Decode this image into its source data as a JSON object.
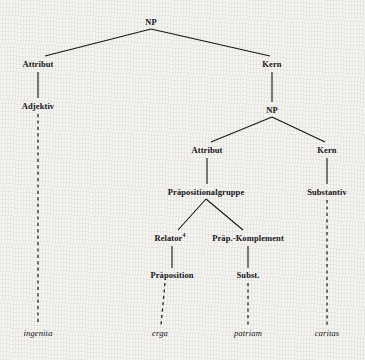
{
  "diagram": {
    "type": "syntactic-tree",
    "title": "",
    "language": "de",
    "colors": {
      "ink": "#16161a",
      "paper": "#f6f5f2"
    },
    "nodes": [
      {
        "id": "np-root",
        "label": "NP",
        "kind": "category",
        "x": 151,
        "y": 22
      },
      {
        "id": "attribut-1",
        "label": "Attribut",
        "kind": "category",
        "x": 38,
        "y": 64
      },
      {
        "id": "kern-1",
        "label": "Kern",
        "kind": "category",
        "x": 272,
        "y": 64
      },
      {
        "id": "adjektiv",
        "label": "Adjektiv",
        "kind": "category",
        "x": 38,
        "y": 106
      },
      {
        "id": "np-inner",
        "label": "NP",
        "kind": "category",
        "x": 272,
        "y": 110
      },
      {
        "id": "attribut-2",
        "label": "Attribut",
        "kind": "category",
        "x": 207,
        "y": 150
      },
      {
        "id": "kern-2",
        "label": "Kern",
        "kind": "category",
        "x": 327,
        "y": 150
      },
      {
        "id": "praepositionalgruppe",
        "label": "Präpositionalgruppe",
        "kind": "category",
        "x": 206,
        "y": 192
      },
      {
        "id": "substantiv",
        "label": "Substantiv",
        "kind": "category",
        "x": 327,
        "y": 192
      },
      {
        "id": "relator",
        "label": "Relator",
        "kind": "category",
        "x": 170,
        "y": 238,
        "superscript": "4"
      },
      {
        "id": "praep-komplement",
        "label": "Präp.-Komplement",
        "kind": "category",
        "x": 248,
        "y": 238
      },
      {
        "id": "praeposition",
        "label": "Präposition",
        "kind": "category",
        "x": 172,
        "y": 275
      },
      {
        "id": "subst",
        "label": "Subst.",
        "kind": "category",
        "x": 248,
        "y": 275
      },
      {
        "id": "lex-ingenita",
        "label": "ingenita",
        "kind": "lexical",
        "x": 38,
        "y": 333
      },
      {
        "id": "lex-erga",
        "label": "erga",
        "kind": "lexical",
        "x": 160,
        "y": 333
      },
      {
        "id": "lex-patriam",
        "label": "patriam",
        "kind": "lexical",
        "x": 248,
        "y": 333
      },
      {
        "id": "lex-caritas",
        "label": "caritas",
        "kind": "lexical",
        "x": 327,
        "y": 333
      }
    ],
    "edges": [
      {
        "from": "np-root",
        "to": "attribut-1",
        "style": "solid",
        "x1": 151,
        "y1": 29,
        "x2": 45,
        "y2": 56
      },
      {
        "from": "np-root",
        "to": "kern-1",
        "style": "solid",
        "x1": 151,
        "y1": 29,
        "x2": 270,
        "y2": 56
      },
      {
        "from": "attribut-1",
        "to": "adjektiv",
        "style": "solid",
        "x1": 38,
        "y1": 72,
        "x2": 38,
        "y2": 98
      },
      {
        "from": "kern-1",
        "to": "np-inner",
        "style": "solid",
        "x1": 272,
        "y1": 72,
        "x2": 272,
        "y2": 102
      },
      {
        "from": "np-inner",
        "to": "attribut-2",
        "style": "solid",
        "x1": 272,
        "y1": 117,
        "x2": 211,
        "y2": 142
      },
      {
        "from": "np-inner",
        "to": "kern-2",
        "style": "solid",
        "x1": 272,
        "y1": 117,
        "x2": 325,
        "y2": 142
      },
      {
        "from": "attribut-2",
        "to": "praepositionalgruppe",
        "style": "solid",
        "x1": 207,
        "y1": 158,
        "x2": 207,
        "y2": 184
      },
      {
        "from": "kern-2",
        "to": "substantiv",
        "style": "solid",
        "x1": 327,
        "y1": 158,
        "x2": 327,
        "y2": 184
      },
      {
        "from": "praepositionalgruppe",
        "to": "relator",
        "style": "solid",
        "x1": 206,
        "y1": 199,
        "x2": 178,
        "y2": 230
      },
      {
        "from": "praepositionalgruppe",
        "to": "praep-komplement",
        "style": "solid",
        "x1": 206,
        "y1": 199,
        "x2": 243,
        "y2": 230
      },
      {
        "from": "relator",
        "to": "praeposition",
        "style": "solid",
        "x1": 172,
        "y1": 246,
        "x2": 172,
        "y2": 268
      },
      {
        "from": "praep-komplement",
        "to": "subst",
        "style": "solid",
        "x1": 248,
        "y1": 246,
        "x2": 248,
        "y2": 268
      },
      {
        "from": "adjektiv",
        "to": "lex-ingenita",
        "style": "dashed",
        "x1": 38,
        "y1": 114,
        "x2": 38,
        "y2": 325
      },
      {
        "from": "praeposition",
        "to": "lex-erga",
        "style": "dashed",
        "x1": 165,
        "y1": 283,
        "x2": 161,
        "y2": 325
      },
      {
        "from": "subst",
        "to": "lex-patriam",
        "style": "dashed",
        "x1": 248,
        "y1": 283,
        "x2": 248,
        "y2": 325
      },
      {
        "from": "substantiv",
        "to": "lex-caritas",
        "style": "dashed",
        "x1": 327,
        "y1": 200,
        "x2": 327,
        "y2": 325
      }
    ]
  }
}
